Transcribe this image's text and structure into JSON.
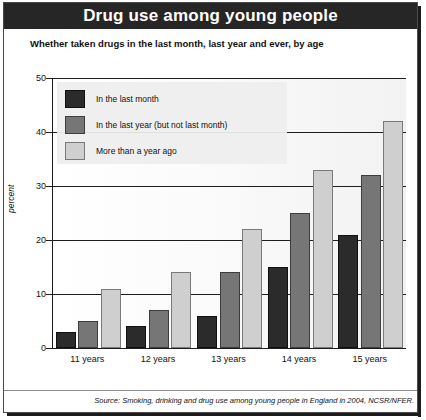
{
  "title": "Drug use among young people",
  "subtitle": "Whether taken drugs in the last month, last year and ever, by age",
  "source": "Source: Smoking, drinking and drug use among young people in England in 2004, NCSR/NFER.",
  "colors": {
    "banner_bg": "#262626",
    "banner_text": "#ffffff",
    "series_last_month": "#2b2b2b",
    "series_last_year": "#767676",
    "series_more_than_year": "#cfcfcf",
    "axis": "#1d1d1d",
    "plot_bg": "#fbfbfb"
  },
  "legend": {
    "position": "top-left-inside",
    "items": [
      {
        "label": "In the last month",
        "color": "#2b2b2b"
      },
      {
        "label": "In the last year (but not last month)",
        "color": "#767676"
      },
      {
        "label": "More than a year ago",
        "color": "#cfcfcf"
      }
    ]
  },
  "chart_data": {
    "type": "bar",
    "title": "Drug use among young people",
    "subtitle": "Whether taken drugs in the last month, last year and ever, by age",
    "xlabel": "",
    "ylabel": "percent",
    "ylim": [
      0,
      50
    ],
    "yticks": [
      0,
      10,
      20,
      30,
      40,
      50
    ],
    "ytick_labels": [
      "0",
      "10",
      "20",
      "30",
      "40",
      "50"
    ],
    "grid": true,
    "grid_axis": "y",
    "legend_position": "upper left",
    "categories": [
      "11 years",
      "12 years",
      "13 years",
      "14 years",
      "15 years"
    ],
    "series": [
      {
        "name": "In the last month",
        "color": "#2b2b2b",
        "values": [
          3,
          4,
          6,
          15,
          21
        ]
      },
      {
        "name": "In the last year (but not last month)",
        "color": "#767676",
        "values": [
          5,
          7,
          14,
          25,
          32
        ]
      },
      {
        "name": "More than a year ago",
        "color": "#cfcfcf",
        "values": [
          11,
          14,
          22,
          33,
          42
        ]
      }
    ],
    "source": "Source: Smoking, drinking and drug use among young people in England in 2004, NCSR/NFER."
  }
}
